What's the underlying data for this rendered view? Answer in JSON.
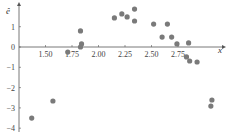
{
  "chart_data": {
    "type": "scatter",
    "title": "",
    "xlabel": "x",
    "ylabel": "ê",
    "xlim": [
      1.25,
      3.2
    ],
    "ylim": [
      -4,
      2.3
    ],
    "grid": false,
    "legend": null,
    "x_ticks": [
      1.5,
      1.75,
      2.0,
      2.25,
      2.5,
      2.75
    ],
    "x_tick_labels": [
      "1.50",
      "1.75",
      "2.00",
      "2.25",
      "2.50",
      "2.75"
    ],
    "y_ticks": [
      1,
      0,
      -1,
      -2,
      -3,
      -4
    ],
    "y_tick_labels": [
      "1",
      "0",
      "−1",
      "−2",
      "−3",
      "−4"
    ],
    "marker_color": "#7a7a7a",
    "axis_color": "#555555",
    "series": [
      {
        "name": "residuals",
        "points": [
          {
            "x": 1.37,
            "y": -3.5
          },
          {
            "x": 1.57,
            "y": -2.66
          },
          {
            "x": 1.71,
            "y": -0.25
          },
          {
            "x": 1.83,
            "y": 0.79
          },
          {
            "x": 1.83,
            "y": 0.0
          },
          {
            "x": 1.84,
            "y": 0.15
          },
          {
            "x": 2.15,
            "y": 1.43
          },
          {
            "x": 2.22,
            "y": 1.63
          },
          {
            "x": 2.27,
            "y": 1.48
          },
          {
            "x": 2.34,
            "y": 1.87
          },
          {
            "x": 2.34,
            "y": 1.28
          },
          {
            "x": 2.52,
            "y": 1.13
          },
          {
            "x": 2.65,
            "y": 1.13
          },
          {
            "x": 2.6,
            "y": 0.49
          },
          {
            "x": 2.69,
            "y": 0.49
          },
          {
            "x": 2.74,
            "y": 0.15
          },
          {
            "x": 2.85,
            "y": 0.2
          },
          {
            "x": 2.83,
            "y": -0.49
          },
          {
            "x": 2.86,
            "y": -0.69
          },
          {
            "x": 2.93,
            "y": -0.74
          },
          {
            "x": 3.07,
            "y": -2.61
          },
          {
            "x": 3.06,
            "y": -2.91
          }
        ]
      }
    ]
  }
}
